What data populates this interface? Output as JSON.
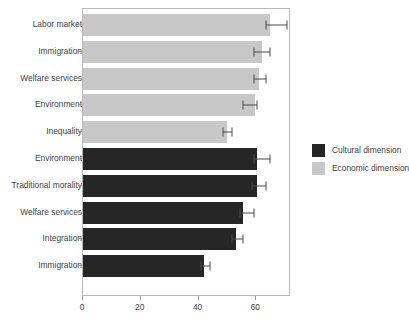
{
  "chart_data": {
    "type": "bar",
    "orientation": "horizontal",
    "title": "",
    "xlabel": "",
    "ylabel": "",
    "xlim": [
      0,
      72
    ],
    "xticks": [
      0,
      20,
      40,
      60
    ],
    "xticklabels": [
      "0",
      "20",
      "40",
      "60"
    ],
    "grid": false,
    "legend_position": "right",
    "legend": [
      {
        "name": "Cultural dimension",
        "color": "#262626"
      },
      {
        "name": "Economic dimension",
        "color": "#c8c8c8"
      }
    ],
    "categories": [
      "Labor market",
      "Immigration",
      "Welfare services",
      "Environment",
      "Inequality",
      "Environment",
      "Traditional morality",
      "Welfare services",
      "Integration",
      "Immigration"
    ],
    "bars": [
      {
        "label": "Labor market",
        "series": "Economic dimension",
        "value": 64.6,
        "err_low": 63.3,
        "err_high": 70.6
      },
      {
        "label": "Immigration",
        "series": "Economic dimension",
        "value": 61.8,
        "err_low": 59.3,
        "err_high": 64.6
      },
      {
        "label": "Welfare services",
        "series": "Economic dimension",
        "value": 61.0,
        "err_low": 59.3,
        "err_high": 63.3
      },
      {
        "label": "Environment",
        "series": "Economic dimension",
        "value": 59.6,
        "err_low": 55.4,
        "err_high": 60.3
      },
      {
        "label": "Inequality",
        "series": "Economic dimension",
        "value": 49.7,
        "err_low": 48.3,
        "err_high": 51.5
      },
      {
        "label": "Environment",
        "series": "Cultural dimension",
        "value": 60.3,
        "err_low": 59.3,
        "err_high": 64.6
      },
      {
        "label": "Traditional morality",
        "series": "Cultural dimension",
        "value": 60.3,
        "err_low": 58.5,
        "err_high": 63.3
      },
      {
        "label": "Welfare services",
        "series": "Cultural dimension",
        "value": 55.4,
        "err_low": 54.3,
        "err_high": 59.3
      },
      {
        "label": "Integration",
        "series": "Cultural dimension",
        "value": 52.9,
        "err_low": 51.5,
        "err_high": 55.4
      },
      {
        "label": "Immigration",
        "series": "Cultural dimension",
        "value": 41.9,
        "err_low": 40.8,
        "err_high": 44.0
      }
    ]
  }
}
